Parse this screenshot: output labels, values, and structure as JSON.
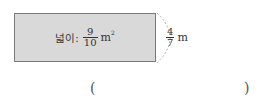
{
  "figure": {
    "area_label": "넓이:",
    "area_fraction": {
      "numerator": "9",
      "denominator": "10"
    },
    "area_unit": "m",
    "area_unit_exponent": "2",
    "side_fraction": {
      "numerator": "4",
      "denominator": "7"
    },
    "side_unit": "m"
  },
  "answer": {
    "open_paren": "(",
    "close_paren": ")",
    "value": ""
  }
}
